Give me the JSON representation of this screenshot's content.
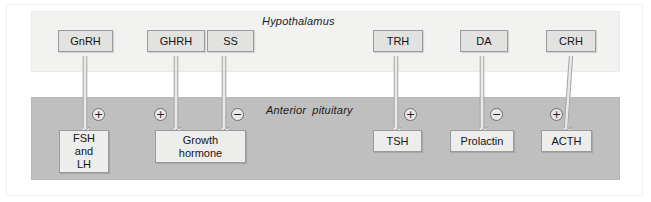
{
  "figure": {
    "bands": [
      {
        "key": "hypothalamus",
        "label": "Hypothalamus",
        "color": "#f2f2f0"
      },
      {
        "key": "pituitary",
        "label": "Anterior pituitary",
        "color": "#bfbfbf"
      }
    ],
    "hypothalamic_hormones": [
      {
        "id": "gnrh",
        "label": "GnRH"
      },
      {
        "id": "ghrh",
        "label": "GHRH"
      },
      {
        "id": "ss",
        "label": "SS"
      },
      {
        "id": "trh",
        "label": "TRH"
      },
      {
        "id": "da",
        "label": "DA"
      },
      {
        "id": "crh",
        "label": "CRH"
      }
    ],
    "pituitary_hormones": [
      {
        "id": "fsh-lh",
        "lines": [
          "FSH",
          "and",
          "LH"
        ]
      },
      {
        "id": "growth-hormone",
        "lines": [
          "Growth",
          "hormone"
        ]
      },
      {
        "id": "tsh",
        "lines": [
          "TSH"
        ]
      },
      {
        "id": "prolactin",
        "lines": [
          "Prolactin"
        ]
      },
      {
        "id": "acth",
        "lines": [
          "ACTH"
        ]
      }
    ],
    "connections": [
      {
        "from": "GnRH",
        "to": "FSH and LH",
        "effect": "+"
      },
      {
        "from": "GHRH",
        "to": "Growth hormone",
        "effect": "+"
      },
      {
        "from": "SS",
        "to": "Growth hormone",
        "effect": "−"
      },
      {
        "from": "TRH",
        "to": "TSH",
        "effect": "+"
      },
      {
        "from": "DA",
        "to": "Prolactin",
        "effect": "−"
      },
      {
        "from": "CRH",
        "to": "ACTH",
        "effect": "+"
      }
    ],
    "signs": {
      "plus": "+",
      "minus": "−"
    }
  }
}
